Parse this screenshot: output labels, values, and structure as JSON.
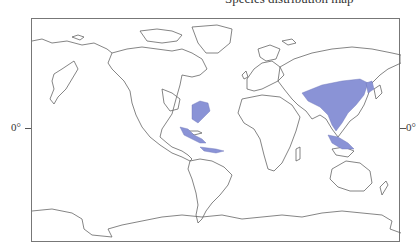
{
  "title": "Species distribution map",
  "map": {
    "projection": "equirectangular",
    "frame": {
      "border_color": "#777777"
    },
    "coast_color": "#666666",
    "highlight_color": "#8a93d6",
    "highlighted_regions": [
      "Eastern North America (US Southeast)",
      "Central America & Caribbean",
      "Northern South America coast",
      "East & Southeast Asia (China, Japan, Indochina, Indonesia)"
    ]
  },
  "axis": {
    "left_label": "0°",
    "right_label": "0°"
  }
}
